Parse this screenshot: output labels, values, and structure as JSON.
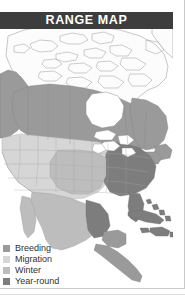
{
  "widget": {
    "name": "range-map",
    "width": 185,
    "height": 297,
    "background": "#ffffff"
  },
  "banner": {
    "title": "RANGE MAP",
    "background_color": "#3d3d3d",
    "text_color": "#ffffff"
  },
  "legend": {
    "items": [
      {
        "label": "Breeding",
        "color": "#9a9a9a"
      },
      {
        "label": "Migration",
        "color": "#d6d6d6"
      },
      {
        "label": "Winter",
        "color": "#bdbdbd"
      },
      {
        "label": "Year-round",
        "color": "#7d7d7d"
      }
    ]
  },
  "map": {
    "region": "North America",
    "ocean_color": "#ffffff",
    "land_outline_color": "#8c8c8c",
    "border_color": "#9e9e9e",
    "no_range_color": "#fbfbfb",
    "breeding_color": "#9a9a9a",
    "migration_color": "#d6d6d6",
    "winter_color": "#bdbdbd",
    "year_round_color": "#7d7d7d",
    "lake_color": "#ffffff",
    "areas": [
      {
        "name": "arctic-canada-no-range",
        "category": "none"
      },
      {
        "name": "western-canada-breeding",
        "category": "breeding"
      },
      {
        "name": "central-canada-breeding",
        "category": "breeding"
      },
      {
        "name": "eastern-canada-breeding",
        "category": "breeding"
      },
      {
        "name": "western-us-migration",
        "category": "migration"
      },
      {
        "name": "great-plains-migration",
        "category": "migration"
      },
      {
        "name": "eastern-us-year-round",
        "category": "year-round"
      },
      {
        "name": "southeast-us-year-round",
        "category": "year-round"
      },
      {
        "name": "florida-year-round",
        "category": "year-round"
      },
      {
        "name": "mexico-winter",
        "category": "winter"
      },
      {
        "name": "central-america-winter",
        "category": "winter"
      },
      {
        "name": "caribbean-year-round",
        "category": "year-round"
      }
    ]
  }
}
